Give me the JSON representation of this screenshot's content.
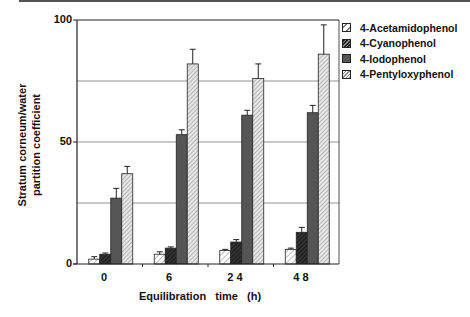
{
  "chart_data": {
    "type": "bar",
    "title": "",
    "xlabel": "Equilibration   time   (h)",
    "ylabel": "Stratum corneum/water partition coefficient",
    "ylabel_lines": [
      "Stratum corneum/water",
      "partition coefficient"
    ],
    "categories": [
      "0",
      "6",
      "2 4",
      "4 8"
    ],
    "ylim": [
      0,
      100
    ],
    "yticks": [
      0,
      50,
      100
    ],
    "gridlines": [
      25,
      50,
      75
    ],
    "grid": true,
    "legend_position": "upper right (outside plot)",
    "series": [
      {
        "name": "4-Acetamidophenol",
        "pattern": "light-hatch",
        "values": [
          2,
          4,
          5.5,
          6
        ],
        "error_upper": [
          3,
          5,
          6,
          6.5
        ]
      },
      {
        "name": "4-Cyanophenol",
        "pattern": "dark-hatch",
        "values": [
          4,
          6.5,
          9,
          13
        ],
        "error_upper": [
          4.5,
          7,
          10,
          15
        ]
      },
      {
        "name": "4-Iodophenol",
        "pattern": "solid-dark-gray",
        "values": [
          27,
          53,
          61,
          62
        ],
        "error_upper": [
          31,
          55,
          63,
          65
        ]
      },
      {
        "name": "4-Pentyloxyphenol",
        "pattern": "gray-hatch",
        "values": [
          37,
          82,
          76,
          86
        ],
        "error_upper": [
          40,
          88,
          82,
          98
        ]
      }
    ]
  },
  "axis": {
    "ytick_labels": [
      "100",
      "50",
      "0"
    ],
    "xtick_labels": [
      "0",
      "6",
      "2 4",
      "4 8"
    ]
  },
  "legend": {
    "items": [
      {
        "label": "4-Acetamidophenol",
        "swatch": "pat-acet"
      },
      {
        "label": "4-Cyanophenol",
        "swatch": "pat-cyano"
      },
      {
        "label": "4-Iodophenol",
        "swatch": "pat-iodo"
      },
      {
        "label": "4-Pentyloxyphenol",
        "swatch": "pat-pent"
      }
    ]
  },
  "colors": {
    "axis": "#222222",
    "grid": "#777777",
    "iodo_fill": "#555555"
  }
}
